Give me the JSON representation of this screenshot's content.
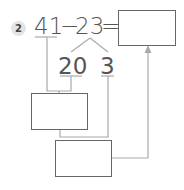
{
  "problem": {
    "number": "2",
    "minuend": "41",
    "operator": "−",
    "subtrahend": "23",
    "equals": "=",
    "decomposition": {
      "tens_part": "20",
      "ones_part": "3"
    },
    "boxes": {
      "answer": "",
      "intermediate_1": "",
      "intermediate_2": ""
    }
  },
  "colors": {
    "text": "#555555",
    "box_border": "#666666",
    "connector": "#aaaaaa",
    "badge_bg": "#e4e4e4"
  }
}
